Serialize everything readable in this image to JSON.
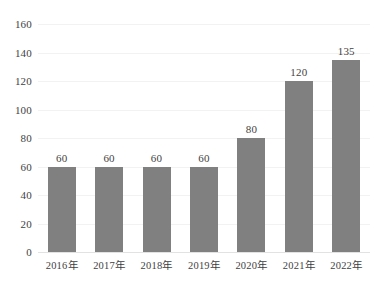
{
  "chart_data": {
    "type": "bar",
    "title": "",
    "subtitle": "",
    "xlabel": "",
    "ylabel": "",
    "categories": [
      "2016年",
      "2017年",
      "2018年",
      "2019年",
      "2020年",
      "2021年",
      "2022年"
    ],
    "values": [
      60,
      60,
      60,
      60,
      80,
      120,
      135
    ],
    "data_labels": [
      "60",
      "60",
      "60",
      "60",
      "80",
      "120",
      "135"
    ],
    "ylim": [
      0,
      160
    ],
    "y_ticks": [
      0,
      20,
      40,
      60,
      80,
      100,
      120,
      140,
      160
    ],
    "y_tick_labels": [
      "0",
      "20",
      "40",
      "60",
      "80",
      "100",
      "120",
      "140",
      "160"
    ],
    "grid": true,
    "grid_axis": "y",
    "legend": false,
    "legend_position": "none",
    "series": [
      {
        "name": "",
        "values": [
          60,
          60,
          60,
          60,
          80,
          120,
          135
        ]
      }
    ],
    "colors": {
      "bar": "#808080",
      "gridline": "#f2f2f2",
      "baseline": "#e2e2e2",
      "text": "#3f3f3f",
      "background": "#ffffff"
    }
  }
}
